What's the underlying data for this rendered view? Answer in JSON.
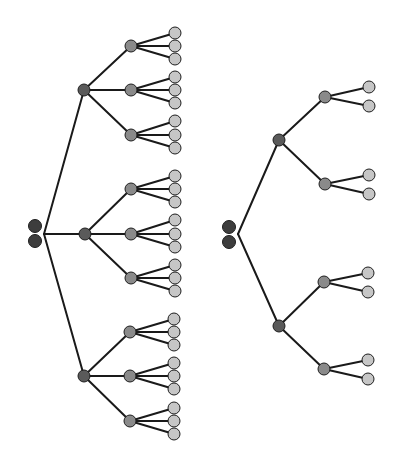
{
  "colors": {
    "root": "#3d3d3d",
    "level1": "#5a5a5a",
    "level2": "#8a8a8a",
    "leaf": "#c6c6c6",
    "stroke": "#1e1e1e",
    "edge": "#1a1a1a"
  },
  "trees": [
    {
      "name": "tree-left-ternary",
      "root": {
        "circles": [
          [
            35,
            226
          ],
          [
            35,
            241
          ]
        ],
        "origin": [
          44,
          234
        ]
      },
      "level1": [
        {
          "pos": [
            84,
            90
          ],
          "children": [
            {
              "pos": [
                131,
                46
              ],
              "leaves": [
                [
                  175,
                  33
                ],
                [
                  175,
                  46
                ],
                [
                  175,
                  59
                ]
              ]
            },
            {
              "pos": [
                131,
                90
              ],
              "leaves": [
                [
                  175,
                  77
                ],
                [
                  175,
                  90
                ],
                [
                  175,
                  103
                ]
              ]
            },
            {
              "pos": [
                131,
                135
              ],
              "leaves": [
                [
                  175,
                  121
                ],
                [
                  175,
                  135
                ],
                [
                  175,
                  148
                ]
              ]
            }
          ]
        },
        {
          "pos": [
            85,
            234
          ],
          "children": [
            {
              "pos": [
                131,
                189
              ],
              "leaves": [
                [
                  175,
                  176
                ],
                [
                  175,
                  189
                ],
                [
                  175,
                  202
                ]
              ]
            },
            {
              "pos": [
                131,
                234
              ],
              "leaves": [
                [
                  175,
                  220
                ],
                [
                  175,
                  234
                ],
                [
                  175,
                  247
                ]
              ]
            },
            {
              "pos": [
                131,
                278
              ],
              "leaves": [
                [
                  175,
                  265
                ],
                [
                  175,
                  278
                ],
                [
                  175,
                  291
                ]
              ]
            }
          ]
        },
        {
          "pos": [
            84,
            376
          ],
          "children": [
            {
              "pos": [
                130,
                332
              ],
              "leaves": [
                [
                  174,
                  319
                ],
                [
                  174,
                  332
                ],
                [
                  174,
                  345
                ]
              ]
            },
            {
              "pos": [
                130,
                376
              ],
              "leaves": [
                [
                  174,
                  363
                ],
                [
                  174,
                  376
                ],
                [
                  174,
                  389
                ]
              ]
            },
            {
              "pos": [
                130,
                421
              ],
              "leaves": [
                [
                  174,
                  408
                ],
                [
                  174,
                  421
                ],
                [
                  174,
                  434
                ]
              ]
            }
          ]
        }
      ]
    },
    {
      "name": "tree-right-binary",
      "root": {
        "circles": [
          [
            229,
            227
          ],
          [
            229,
            242
          ]
        ],
        "origin": [
          238,
          234
        ]
      },
      "level1": [
        {
          "pos": [
            279,
            140
          ],
          "children": [
            {
              "pos": [
                325,
                97
              ],
              "leaves": [
                [
                  369,
                  87
                ],
                [
                  369,
                  106
                ]
              ]
            },
            {
              "pos": [
                325,
                184
              ],
              "leaves": [
                [
                  369,
                  175
                ],
                [
                  369,
                  194
                ]
              ]
            }
          ]
        },
        {
          "pos": [
            279,
            326
          ],
          "children": [
            {
              "pos": [
                324,
                282
              ],
              "leaves": [
                [
                  368,
                  273
                ],
                [
                  368,
                  292
                ]
              ]
            },
            {
              "pos": [
                324,
                369
              ],
              "leaves": [
                [
                  368,
                  360
                ],
                [
                  368,
                  379
                ]
              ]
            }
          ]
        }
      ]
    }
  ],
  "radii": {
    "root": 6.5,
    "level1": 6,
    "level2": 6,
    "leaf": 6
  }
}
